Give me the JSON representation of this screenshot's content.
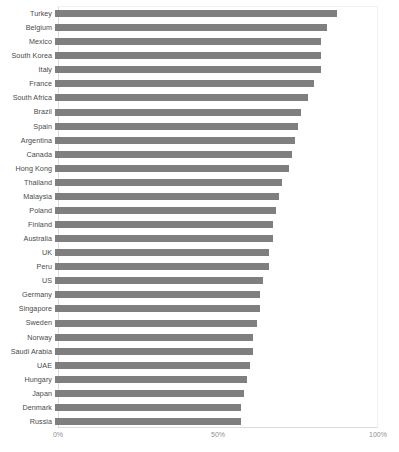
{
  "chart": {
    "type": "bar",
    "orientation": "horizontal",
    "title": "",
    "xlabel": "",
    "ylabel": "",
    "bar_color": "#7f7f7f",
    "label_color": "#4a4a4a",
    "tick_color": "#8f8f8f",
    "background": "#ffffff",
    "grid": false,
    "legend": "none"
  },
  "chart_data": {
    "type": "bar",
    "orientation": "horizontal",
    "title": "",
    "xlabel": "",
    "ylabel": "",
    "grid": false,
    "legend": "none",
    "xlim": [
      0,
      100
    ],
    "xticks": [
      0,
      50,
      100
    ],
    "xticklabels": [
      "0%",
      "50%",
      "100%"
    ],
    "categories": [
      "Turkey",
      "Belgium",
      "Mexico",
      "South Korea",
      "Italy",
      "France",
      "South Africa",
      "Brazil",
      "Spain",
      "Argentina",
      "Canada",
      "Hong Kong",
      "Thailand",
      "Malaysia",
      "Poland",
      "Finland",
      "Australia",
      "UK",
      "Peru",
      "US",
      "Germany",
      "Singapore",
      "Sweden",
      "Norway",
      "Saudi Arabia",
      "UAE",
      "Hungary",
      "Japan",
      "Denmark",
      "Russia"
    ],
    "values": [
      88,
      85,
      83,
      83,
      83,
      81,
      79,
      77,
      76,
      75,
      74,
      73,
      71,
      70,
      69,
      68,
      68,
      67,
      67,
      65,
      64,
      64,
      63,
      62,
      62,
      61,
      60,
      59,
      58,
      58
    ]
  }
}
